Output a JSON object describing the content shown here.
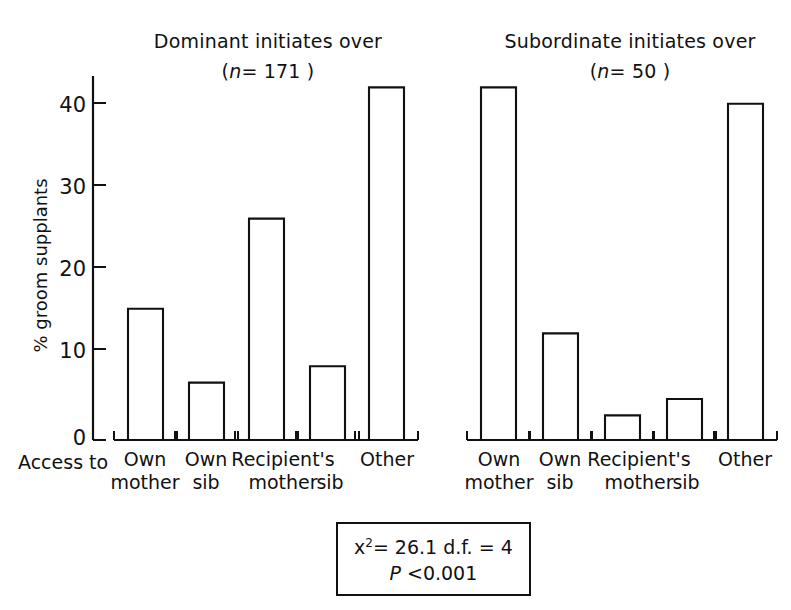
{
  "chart_data": {
    "type": "bar",
    "title": "",
    "xlabel": "Access to",
    "ylabel": "% groom supplants",
    "ylim": [
      0,
      45
    ],
    "yticks": [
      0,
      10,
      20,
      30,
      40
    ],
    "ytick_labels": [
      "0",
      "10",
      "20",
      "30",
      "40"
    ],
    "grid": false,
    "legend": false,
    "categories": [
      "Own mother",
      "Own sib",
      "Recipient's mother",
      "Recipient's sib",
      "Other"
    ],
    "category_lines": [
      [
        "Own",
        "mother"
      ],
      [
        "Own",
        "sib"
      ],
      [
        "Recipient's",
        "mother"
      ],
      [
        "",
        "sib"
      ],
      [
        "Other",
        ""
      ]
    ],
    "panels": [
      {
        "title": "Dominant initiates over",
        "n_label": "( n = 171 )",
        "n": 171,
        "values": [
          16,
          7,
          27,
          9,
          43
        ]
      },
      {
        "title": "Subordinate initiates over",
        "n_label": "( n = 50 )",
        "n": 50,
        "values": [
          43,
          13,
          3,
          5,
          41
        ]
      }
    ],
    "annotations": {
      "stats_line1_prefix": "x",
      "stats_line1_sup": "2",
      "stats_line1_rest": "= 26.1   d.f. = 4",
      "stats_line2_italic": "P",
      "stats_line2_rest": " <0.001",
      "chi_square": 26.1,
      "df": 4,
      "p": "<0.001"
    }
  },
  "axis": {
    "y_label": "% groom supplants",
    "x_prefix_label": "Access to",
    "tick_0": "0",
    "tick_10": "10",
    "tick_20": "20",
    "tick_30": "30",
    "tick_40": "40"
  },
  "panel_left": {
    "title": "Dominant initiates over",
    "n_open": "(",
    "n_italic": "n",
    "n_rest": "= 171 )",
    "bars": [
      {
        "label_top": "Own",
        "label_bottom": "mother",
        "value": 16
      },
      {
        "label_top": "Own",
        "label_bottom": "sib",
        "value": 7
      },
      {
        "label_top": "Recipient's",
        "label_bottom": "mother",
        "value": 27
      },
      {
        "label_top": "",
        "label_bottom": "sib",
        "value": 9
      },
      {
        "label_top": "Other",
        "label_bottom": "",
        "value": 43
      }
    ]
  },
  "panel_right": {
    "title": "Subordinate initiates over",
    "n_open": "(",
    "n_italic": "n",
    "n_rest": "= 50 )",
    "bars": [
      {
        "label_top": "Own",
        "label_bottom": "mother",
        "value": 43
      },
      {
        "label_top": "Own",
        "label_bottom": "sib",
        "value": 13
      },
      {
        "label_top": "Recipient's",
        "label_bottom": "mother",
        "value": 3
      },
      {
        "label_top": "",
        "label_bottom": "sib",
        "value": 5
      },
      {
        "label_top": "Other",
        "label_bottom": "",
        "value": 41
      }
    ]
  },
  "stats": {
    "chi_prefix": "x",
    "chi_sup": "2",
    "chi_rest": "= 26.1   d.f. = 4",
    "p_italic": "P",
    "p_rest": " <0.001"
  },
  "colors": {
    "ink": "#111111",
    "background": "#ffffff"
  }
}
